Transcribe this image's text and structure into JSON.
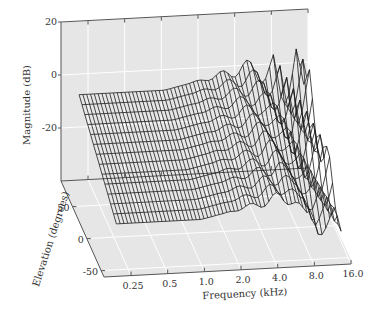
{
  "chart_data": {
    "type": "surface3d",
    "title": "",
    "zlabel": "Magnitude (dB)",
    "xlabel": "Frequency (kHz)",
    "ylabel": "Elevation (degrees)",
    "z_ticks": [
      "20",
      "0",
      "-20"
    ],
    "z_tick_values": [
      20,
      0,
      -20
    ],
    "zlim": [
      -40,
      20
    ],
    "x_ticks": [
      "0.25",
      "0.5",
      "1.0",
      "2.0",
      "4.0",
      "8.0",
      "16.0"
    ],
    "x_tick_values": [
      0.25,
      0.5,
      1.0,
      2.0,
      4.0,
      8.0,
      16.0
    ],
    "x_scale": "log",
    "xlim": [
      0.15,
      16.0
    ],
    "y_ticks": [
      "50",
      "0",
      "-50"
    ],
    "y_tick_values": [
      50,
      0,
      -50
    ],
    "ylim": [
      -60,
      90
    ],
    "grid": true,
    "colors": {
      "pane": "#e6e6e6",
      "grid": "#ffffff",
      "mesh_line": "#1a1a1a",
      "axis_line": "#555555"
    },
    "series": [
      {
        "name": "HRTF magnitude surface",
        "description": "Mesh of magnitude (dB) over frequency (log, ~0.15–16 kHz) and elevation (-50 to 90 deg). Smooth at low frequencies (about -5 dB at high elevation down to about -25 dB at low elevation); increasing ripple above ~2 kHz with peaks near 0 to +3 dB around 4–6 kHz and deep notches down to about -40 dB between 6 and 16 kHz.",
        "approx_profile_by_frequency_khz": [
          {
            "freq": 0.15,
            "z_at_top_elevation": -5,
            "z_at_bottom_elevation": -22
          },
          {
            "freq": 0.5,
            "z_at_top_elevation": -4,
            "z_at_bottom_elevation": -24
          },
          {
            "freq": 1.0,
            "z_at_top_elevation": -3,
            "z_at_bottom_elevation": -22
          },
          {
            "freq": 2.0,
            "z_at_top_elevation": -1,
            "z_at_bottom_elevation": -20
          },
          {
            "freq": 4.0,
            "z_at_top_elevation": 2,
            "z_at_bottom_elevation": -18
          },
          {
            "freq": 8.0,
            "z_at_top_elevation": -5,
            "z_at_bottom_elevation": -38
          },
          {
            "freq": 16.0,
            "z_at_top_elevation": -15,
            "z_at_bottom_elevation": -30
          }
        ]
      }
    ]
  }
}
